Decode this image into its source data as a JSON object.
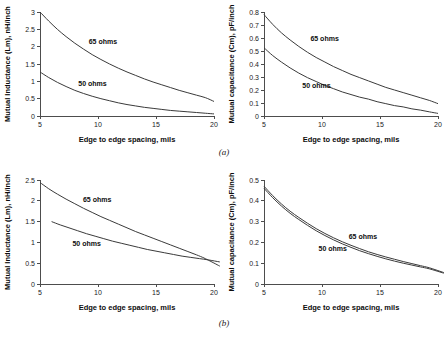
{
  "figure": {
    "caption_a": "(a)",
    "caption_b": "(b)"
  },
  "chart_data": [
    {
      "id": "panel-a-inductance",
      "type": "line",
      "panel": "a",
      "position": "top-left",
      "title": "",
      "xlabel": "Edge to edge spacing, mils",
      "ylabel": "Mutual Inductance (Lm), nH/inch",
      "xlim": [
        5,
        20
      ],
      "ylim": [
        0,
        3
      ],
      "xticks": [
        5,
        10,
        15,
        20
      ],
      "yticks": [
        0,
        0.5,
        1,
        1.5,
        2,
        2.5,
        3
      ],
      "ytick_labels": [
        "0",
        "0.5",
        "1",
        "1.5",
        "2",
        "2.5",
        "3"
      ],
      "xtick_labels": [
        "5",
        "10",
        "15",
        "20"
      ],
      "grid": false,
      "legend_position": "inline-annotation",
      "series": [
        {
          "name": "65 ohms",
          "label": "65 ohms",
          "color": "#3a3a3a",
          "label_x": 9.2,
          "label_y": 2.08,
          "x": [
            5,
            5.75,
            6.5,
            7.25,
            8,
            8.75,
            9.5,
            10.25,
            11,
            11.75,
            12.5,
            13.25,
            14,
            14.75,
            15.5,
            16.25,
            17,
            17.75,
            18.5,
            19.25,
            20
          ],
          "y": [
            3.0,
            2.74,
            2.5,
            2.29,
            2.1,
            1.93,
            1.77,
            1.63,
            1.5,
            1.38,
            1.27,
            1.17,
            1.07,
            0.98,
            0.9,
            0.82,
            0.74,
            0.67,
            0.6,
            0.53,
            0.42
          ]
        },
        {
          "name": "50 ohms",
          "label": "50 ohms",
          "color": "#3a3a3a",
          "label_x": 8.3,
          "label_y": 0.86,
          "x": [
            5,
            5.75,
            6.5,
            7.25,
            8,
            8.75,
            9.5,
            10.25,
            11,
            11.75,
            12.5,
            13.25,
            14,
            14.75,
            15.5,
            16.25,
            17,
            17.75,
            18.5,
            19.25,
            20
          ],
          "y": [
            1.27,
            1.11,
            0.97,
            0.85,
            0.74,
            0.65,
            0.57,
            0.5,
            0.44,
            0.38,
            0.33,
            0.29,
            0.25,
            0.22,
            0.19,
            0.16,
            0.14,
            0.12,
            0.1,
            0.08,
            0.06
          ]
        }
      ]
    },
    {
      "id": "panel-a-capacitance",
      "type": "line",
      "panel": "a",
      "position": "top-right",
      "title": "",
      "xlabel": "Edge to edge spacing, mils",
      "ylabel": "Mutual capacitance (Cm), pF/inch",
      "xlim": [
        5,
        20
      ],
      "ylim": [
        0,
        0.8
      ],
      "xticks": [
        5,
        10,
        15,
        20
      ],
      "yticks": [
        0,
        0.1,
        0.2,
        0.3,
        0.4,
        0.5,
        0.6,
        0.7,
        0.8
      ],
      "ytick_labels": [
        "0",
        "0.1",
        "0.2",
        "0.3",
        "0.4",
        "0.5",
        "0.6",
        "0.7",
        "0.8"
      ],
      "xtick_labels": [
        "5",
        "10",
        "15",
        "20"
      ],
      "grid": false,
      "legend_position": "inline-annotation",
      "series": [
        {
          "name": "65 ohms",
          "label": "65 ohms",
          "color": "#3a3a3a",
          "label_x": 9.0,
          "label_y": 0.58,
          "x": [
            5,
            5.75,
            6.5,
            7.25,
            8,
            8.75,
            9.5,
            10.25,
            11,
            11.75,
            12.5,
            13.25,
            14,
            14.75,
            15.5,
            16.25,
            17,
            17.75,
            18.5,
            19.25,
            20
          ],
          "y": [
            0.78,
            0.705,
            0.64,
            0.585,
            0.535,
            0.49,
            0.45,
            0.415,
            0.38,
            0.35,
            0.32,
            0.295,
            0.27,
            0.245,
            0.22,
            0.2,
            0.18,
            0.16,
            0.14,
            0.12,
            0.095
          ]
        },
        {
          "name": "50 ohms",
          "label": "50 ohms",
          "color": "#3a3a3a",
          "label_x": 8.3,
          "label_y": 0.215,
          "x": [
            5,
            5.75,
            6.5,
            7.25,
            8,
            8.75,
            9.5,
            10.25,
            11,
            11.75,
            12.5,
            13.25,
            14,
            14.75,
            15.5,
            16.25,
            17,
            17.75,
            18.5,
            19.25,
            20
          ],
          "y": [
            0.525,
            0.465,
            0.415,
            0.37,
            0.33,
            0.295,
            0.265,
            0.235,
            0.21,
            0.185,
            0.165,
            0.145,
            0.13,
            0.11,
            0.095,
            0.08,
            0.07,
            0.055,
            0.045,
            0.032,
            0.02
          ]
        }
      ]
    },
    {
      "id": "panel-b-inductance",
      "type": "line",
      "panel": "b",
      "position": "bottom-left",
      "title": "",
      "xlabel": "Edge to edge spacing, mils",
      "ylabel": "Mutual Inductance (Lm), nH/inch",
      "xlim": [
        5,
        20
      ],
      "ylim": [
        0,
        2.5
      ],
      "xticks": [
        5,
        10,
        15,
        20
      ],
      "yticks": [
        0,
        0.5,
        1,
        1.5,
        2,
        2.5
      ],
      "ytick_labels": [
        "0",
        "0.5",
        "1",
        "1.5",
        "2",
        "2.5"
      ],
      "xtick_labels": [
        "5",
        "10",
        "15",
        "20"
      ],
      "grid": false,
      "legend_position": "inline-annotation",
      "series": [
        {
          "name": "65 ohms",
          "label": "65 ohms",
          "color": "#3a3a3a",
          "label_x": 8.7,
          "label_y": 1.96,
          "x": [
            5,
            5.75,
            6.5,
            7.25,
            8,
            8.75,
            9.5,
            10.25,
            11,
            11.75,
            12.5,
            13.25,
            14,
            14.75,
            15.5,
            16.25,
            17,
            17.75,
            18.5,
            19.25,
            20.5
          ],
          "y": [
            2.44,
            2.29,
            2.16,
            2.04,
            1.93,
            1.82,
            1.72,
            1.62,
            1.53,
            1.44,
            1.35,
            1.26,
            1.18,
            1.1,
            1.02,
            0.94,
            0.86,
            0.78,
            0.7,
            0.61,
            0.43
          ]
        },
        {
          "name": "50 ohms",
          "label": "50 ohms",
          "color": "#3a3a3a",
          "label_x": 7.8,
          "label_y": 0.92,
          "x": [
            6,
            6.75,
            7.5,
            8.25,
            9,
            9.75,
            10.5,
            11.25,
            12,
            12.75,
            13.5,
            14.25,
            15,
            15.75,
            16.5,
            17.25,
            18,
            18.75,
            19.5,
            20.5
          ],
          "y": [
            1.5,
            1.42,
            1.35,
            1.28,
            1.21,
            1.15,
            1.09,
            1.03,
            0.98,
            0.93,
            0.88,
            0.83,
            0.79,
            0.75,
            0.71,
            0.67,
            0.64,
            0.61,
            0.58,
            0.53
          ]
        }
      ]
    },
    {
      "id": "panel-b-capacitance",
      "type": "line",
      "panel": "b",
      "position": "bottom-right",
      "title": "",
      "xlabel": "Edge to edge spacing, mils",
      "ylabel": "Mutual capacitance (Cm), pF/inch",
      "xlim": [
        5,
        20
      ],
      "ylim": [
        0,
        0.5
      ],
      "xticks": [
        5,
        10,
        15,
        20
      ],
      "yticks": [
        0,
        0.1,
        0.2,
        0.3,
        0.4,
        0.5
      ],
      "ytick_labels": [
        "0",
        "0.1",
        "0.2",
        "0.3",
        "0.4",
        "0.5"
      ],
      "xtick_labels": [
        "5",
        "10",
        "15",
        "20"
      ],
      "grid": false,
      "legend_position": "inline-annotation",
      "series": [
        {
          "name": "65 ohms",
          "label": "65 ohms",
          "color": "#3a3a3a",
          "label_x": 12.3,
          "label_y": 0.215,
          "x": [
            5,
            5.75,
            6.5,
            7.25,
            8,
            8.75,
            9.5,
            10.25,
            11,
            11.75,
            12.5,
            13.25,
            14,
            14.75,
            15.5,
            16.25,
            17,
            17.75,
            18.5,
            19.25,
            20.5
          ],
          "y": [
            0.47,
            0.425,
            0.385,
            0.35,
            0.32,
            0.292,
            0.266,
            0.243,
            0.222,
            0.203,
            0.186,
            0.17,
            0.155,
            0.142,
            0.13,
            0.119,
            0.108,
            0.098,
            0.088,
            0.078,
            0.055
          ]
        },
        {
          "name": "50 ohms",
          "label": "50 ohms",
          "color": "#8c8c8c",
          "label_x": 9.7,
          "label_y": 0.158,
          "x": [
            5,
            5.75,
            6.5,
            7.25,
            8,
            8.75,
            9.5,
            10.25,
            11,
            11.75,
            12.5,
            13.25,
            14,
            14.75,
            15.5,
            16.25,
            17,
            17.75,
            18.5,
            19.25,
            20.5
          ],
          "y": [
            0.46,
            0.415,
            0.375,
            0.34,
            0.31,
            0.282,
            0.256,
            0.233,
            0.212,
            0.193,
            0.176,
            0.16,
            0.146,
            0.133,
            0.121,
            0.11,
            0.1,
            0.091,
            0.082,
            0.073,
            0.052
          ]
        }
      ]
    }
  ]
}
